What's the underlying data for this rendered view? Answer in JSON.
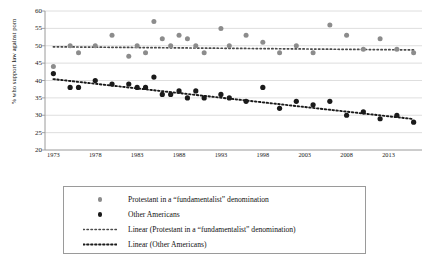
{
  "chart_data": {
    "type": "scatter",
    "title": "",
    "subtitle": "",
    "xlabel": "",
    "ylabel": "% who support law against porn",
    "xlim": [
      1972,
      2017
    ],
    "ylim": [
      20,
      60
    ],
    "ytick_labels": [
      "60",
      "55",
      "50",
      "45",
      "40",
      "35",
      "30",
      "25",
      "20"
    ],
    "ytick_values": [
      60,
      55,
      50,
      45,
      40,
      35,
      30,
      25,
      20
    ],
    "xtick_labels": [
      "1973",
      "1978",
      "1983",
      "1988",
      "1993",
      "1998",
      "2003",
      "2008",
      "2013"
    ],
    "xtick_values": [
      1973,
      1978,
      1983,
      1988,
      1993,
      1998,
      2003,
      2008,
      2013
    ],
    "grid": "horizontal",
    "legend_position": "below",
    "series": [
      {
        "name": "Protestant in a “fundamentalist” denomination",
        "marker": "circle",
        "color": "#8c8c8c",
        "x": [
          1973,
          1975,
          1976,
          1978,
          1980,
          1982,
          1983,
          1984,
          1985,
          1986,
          1987,
          1988,
          1989,
          1990,
          1991,
          1993,
          1994,
          1996,
          1998,
          2000,
          2002,
          2004,
          2006,
          2008,
          2010,
          2012,
          2014,
          2016
        ],
        "y": [
          44,
          50,
          48,
          50,
          53,
          47,
          50,
          48,
          57,
          52,
          50,
          53,
          52,
          50,
          48,
          55,
          50,
          53,
          51,
          48,
          50,
          48,
          56,
          53,
          49,
          52,
          49,
          48
        ]
      },
      {
        "name": "Other Americans",
        "marker": "circle",
        "color": "#1a1a1a",
        "x": [
          1973,
          1975,
          1976,
          1978,
          1980,
          1982,
          1983,
          1984,
          1985,
          1986,
          1987,
          1988,
          1989,
          1990,
          1991,
          1993,
          1994,
          1996,
          1998,
          2000,
          2002,
          2004,
          2006,
          2008,
          2010,
          2012,
          2014,
          2016
        ],
        "y": [
          42,
          38,
          38,
          40,
          39,
          39,
          38,
          38,
          41,
          36,
          36,
          37,
          35,
          37,
          35,
          36,
          35,
          34,
          38,
          32,
          34,
          33,
          34,
          30,
          31,
          29,
          30,
          28
        ]
      }
    ],
    "trendlines": [
      {
        "name": "Linear (Protestant in a “fundamentalist” denomination)",
        "style": "dotted",
        "color": "#4a4a4a",
        "x": [
          1973,
          2016
        ],
        "y": [
          49.7,
          48.8
        ]
      },
      {
        "name": "Linear (Other Americans)",
        "style": "dotted",
        "color": "#1a1a1a",
        "x": [
          1973,
          2016
        ],
        "y": [
          40.4,
          28.9
        ]
      }
    ]
  },
  "legend": {
    "items": [
      {
        "key": "gray-dot-marker",
        "label": "Protestant in a “fundamentalist” denomination"
      },
      {
        "key": "black-dot-marker",
        "label": "Other Americans"
      },
      {
        "key": "gray-dotted-line",
        "label": "Linear (Protestant in a “fundamentalist” denomination)"
      },
      {
        "key": "black-dotted-line",
        "label": "Linear (Other Americans)"
      }
    ]
  },
  "colors": {
    "series_gray": "#8c8c8c",
    "series_black": "#1a1a1a",
    "gridline": "#d6d6d6",
    "axis": "#9a9a9a",
    "legend_border": "#9a9a9a"
  }
}
